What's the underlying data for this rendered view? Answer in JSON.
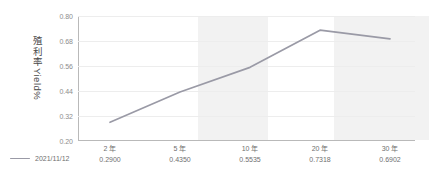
{
  "chart_data": {
    "type": "line",
    "title": "",
    "xlabel": "",
    "ylabel": "殖利率 Yield%",
    "ylabel_cjk": "殖利率",
    "ylabel_latin": "Yield%",
    "categories": [
      "2 年",
      "5 年",
      "10 年",
      "20 年",
      "30 年"
    ],
    "values": [
      0.29,
      0.435,
      0.5535,
      0.7318,
      0.6902
    ],
    "value_labels": [
      "0.2900",
      "0.4350",
      "0.5535",
      "0.7318",
      "0.6902"
    ],
    "series": [
      {
        "name": "2021/11/12",
        "values": [
          0.29,
          0.435,
          0.5535,
          0.7318,
          0.6902
        ],
        "color": "#9a9aa6"
      }
    ],
    "ylim": [
      0.2,
      0.8
    ],
    "yticks": [
      0.8,
      0.68,
      0.56,
      0.44,
      0.32,
      0.2
    ],
    "ytick_labels": [
      "0.80",
      "0.68",
      "0.56",
      "0.44",
      "0.32",
      "0.20"
    ],
    "grid": true,
    "legend_position": "bottom-left",
    "shaded_bands": [
      {
        "start_index": 1.25,
        "end_index": 2.25,
        "color": "#f2f2f2"
      },
      {
        "start_index": 3.2,
        "end_index": 4.55,
        "color": "#f2f2f2"
      }
    ]
  },
  "legend": {
    "entries": [
      {
        "label": "2021/11/12",
        "color": "#9a9aa6"
      }
    ]
  },
  "colors": {
    "line": "#9a9aa6",
    "grid": "#ededed",
    "axis": "#b9b9b9",
    "band": "#f2f2f2",
    "tick_text": "#8d8d8d",
    "label_text": "#6f6f6f"
  }
}
